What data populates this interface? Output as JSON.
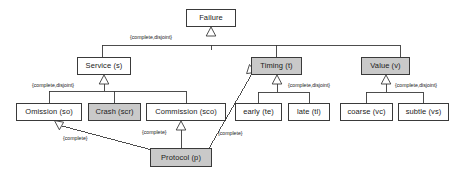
{
  "diagram": {
    "type": "uml-class-generalization",
    "colors": {
      "line": "#3a3a3a",
      "box_border": "#3a3a3a",
      "box_white": "#ffffff",
      "box_gray": "#c9c9c9",
      "text": "#1a1a1a",
      "background": "#ffffff"
    },
    "nodes": [
      {
        "id": "failure",
        "label": "Failure",
        "fill": "white",
        "x": 186,
        "y": 9,
        "w": 50,
        "h": 18
      },
      {
        "id": "service",
        "label": "Service (s)",
        "fill": "white",
        "x": 77,
        "y": 57,
        "w": 54,
        "h": 18
      },
      {
        "id": "timing",
        "label": "Timing (t)",
        "fill": "gray",
        "x": 251,
        "y": 57,
        "w": 51,
        "h": 18
      },
      {
        "id": "value",
        "label": "Value (v)",
        "fill": "gray",
        "x": 361,
        "y": 57,
        "w": 49,
        "h": 18
      },
      {
        "id": "omission",
        "label": "Omission (so)",
        "fill": "white",
        "x": 16,
        "y": 103,
        "w": 66,
        "h": 18
      },
      {
        "id": "crash",
        "label": "Crash (scr)",
        "fill": "gray",
        "x": 88,
        "y": 103,
        "w": 53,
        "h": 18
      },
      {
        "id": "commission",
        "label": "Commission (sco)",
        "fill": "white",
        "x": 146,
        "y": 103,
        "w": 80,
        "h": 18
      },
      {
        "id": "early",
        "label": "early (te)",
        "fill": "white",
        "x": 235,
        "y": 103,
        "w": 47,
        "h": 18
      },
      {
        "id": "late",
        "label": "late (tl)",
        "fill": "white",
        "x": 288,
        "y": 103,
        "w": 42,
        "h": 18
      },
      {
        "id": "coarse",
        "label": "coarse (vc)",
        "fill": "white",
        "x": 340,
        "y": 103,
        "w": 53,
        "h": 18
      },
      {
        "id": "subtle",
        "label": "subtle (vs)",
        "fill": "white",
        "x": 398,
        "y": 103,
        "w": 51,
        "h": 18
      },
      {
        "id": "protocol",
        "label": "Protocol (p)",
        "fill": "gray",
        "x": 150,
        "y": 148,
        "w": 62,
        "h": 19
      }
    ],
    "edge_labels": [
      {
        "id": "lbl-failure-constraint",
        "text": "{complete,disjoint}",
        "x": 130,
        "y": 35
      },
      {
        "id": "lbl-service-constraint",
        "text": "{complete,disjoint}",
        "x": 32,
        "y": 83
      },
      {
        "id": "lbl-timing-constraint",
        "text": "{complete,disjoint}",
        "x": 288,
        "y": 83
      },
      {
        "id": "lbl-value-constraint",
        "text": "{complete,disjoint}",
        "x": 395,
        "y": 83
      },
      {
        "id": "lbl-protocol-omission",
        "text": "{complete}",
        "x": 63,
        "y": 136
      },
      {
        "id": "lbl-protocol-commission",
        "text": "{complete}",
        "x": 142,
        "y": 130
      },
      {
        "id": "lbl-protocol-timing",
        "text": "{complete}",
        "x": 218,
        "y": 131
      }
    ],
    "generalizations": [
      {
        "id": "gen-failure",
        "parent": "failure",
        "children": [
          "service",
          "timing",
          "value"
        ],
        "constraint": "{complete,disjoint}"
      },
      {
        "id": "gen-service",
        "parent": "service",
        "children": [
          "omission",
          "crash",
          "commission"
        ],
        "constraint": "{complete,disjoint}"
      },
      {
        "id": "gen-timing",
        "parent": "timing",
        "children": [
          "early",
          "late"
        ],
        "constraint": "{complete,disjoint}"
      },
      {
        "id": "gen-value",
        "parent": "value",
        "children": [
          "coarse",
          "subtle"
        ],
        "constraint": "{complete,disjoint}"
      },
      {
        "id": "gen-proto-om",
        "parent": "omission",
        "children": [
          "protocol"
        ],
        "constraint": "{complete}"
      },
      {
        "id": "gen-proto-cm",
        "parent": "commission",
        "children": [
          "protocol"
        ],
        "constraint": "{complete}"
      },
      {
        "id": "gen-proto-tm",
        "parent": "timing",
        "children": [
          "protocol"
        ],
        "constraint": "{complete}"
      }
    ]
  }
}
